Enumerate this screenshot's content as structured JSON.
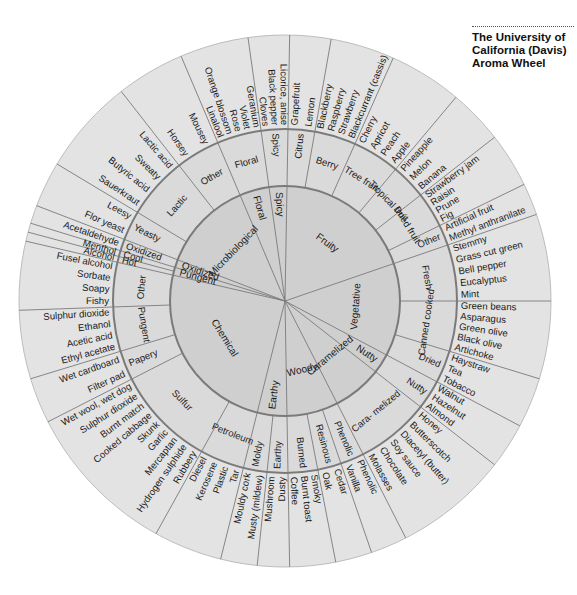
{
  "title": {
    "lines": [
      "The  University of",
      "California (Davis)",
      "Aroma Wheel"
    ]
  },
  "wheel": {
    "center": [
      285,
      301
    ],
    "radii": {
      "inner": 115,
      "middle": 172,
      "outer": 266
    },
    "colors": {
      "inner": "#cfcfcf",
      "middle": "#dadada",
      "outer": "#e3e3e3",
      "lines": "#7a7a7a"
    },
    "tier1": [
      {
        "label": "Fruity",
        "start": 1,
        "end": 71
      },
      {
        "label": "Vegetative",
        "start": 71,
        "end": 118
      },
      {
        "label": "Nutty",
        "start": 118,
        "end": 128
      },
      {
        "label": "Caramelized",
        "start": 128,
        "end": 153
      },
      {
        "label": "Woody",
        "start": 153,
        "end": 179
      },
      {
        "label": "Earthy",
        "start": 179,
        "end": 194
      },
      {
        "label": "Chemical",
        "start": 194,
        "end": 283
      },
      {
        "label": "Pungent",
        "start": 283,
        "end": 287
      },
      {
        "label": "Oxidized",
        "start": 287,
        "end": 291
      },
      {
        "label": "Microbiological",
        "start": 291,
        "end": 337
      },
      {
        "label": "Floral",
        "start": 337,
        "end": 352
      },
      {
        "label": "Spicy",
        "start": 352,
        "end": 361
      }
    ],
    "tier2": [
      {
        "label": "Citrus",
        "start": 1,
        "end": 10
      },
      {
        "label": "Berry",
        "start": 10,
        "end": 24
      },
      {
        "label": "Tree fruit",
        "start": 24,
        "end": 40
      },
      {
        "label": "Tropical fruit",
        "start": 40,
        "end": 52
      },
      {
        "label": "Dried fruit",
        "start": 52,
        "end": 64
      },
      {
        "label": "Other",
        "start": 64,
        "end": 71
      },
      {
        "label": "Fresh",
        "start": 71,
        "end": 90
      },
      {
        "label": "Canned cooked",
        "start": 90,
        "end": 107
      },
      {
        "label": "Dried",
        "start": 107,
        "end": 118
      },
      {
        "label": "Nutty",
        "start": 118,
        "end": 128
      },
      {
        "label": "Cara- melized",
        "start": 128,
        "end": 153
      },
      {
        "label": "Phenolic",
        "start": 153,
        "end": 161
      },
      {
        "label": "Resinous",
        "start": 161,
        "end": 169
      },
      {
        "label": "Burned",
        "start": 169,
        "end": 179
      },
      {
        "label": "Earthy",
        "start": 179,
        "end": 186
      },
      {
        "label": "Moldy",
        "start": 186,
        "end": 194
      },
      {
        "label": "Petroleum",
        "start": 194,
        "end": 209
      },
      {
        "label": "Sulfur",
        "start": 209,
        "end": 243
      },
      {
        "label": "Papery",
        "start": 243,
        "end": 253
      },
      {
        "label": "Pungent",
        "start": 253,
        "end": 268
      },
      {
        "label": "Other",
        "start": 268,
        "end": 283
      },
      {
        "label": "Hot",
        "start": 283,
        "end": 285
      },
      {
        "label": "Cool",
        "start": 285,
        "end": 287
      },
      {
        "label": "Oxidized",
        "start": 287,
        "end": 291
      },
      {
        "label": "Yeasty",
        "start": 291,
        "end": 301
      },
      {
        "label": "Lactic",
        "start": 301,
        "end": 322
      },
      {
        "label": "Other",
        "start": 322,
        "end": 337
      },
      {
        "label": "Floral",
        "start": 337,
        "end": 352
      },
      {
        "label": "Spicy",
        "start": 352,
        "end": 361
      }
    ],
    "tier3": [
      {
        "group": "Citrus",
        "start": 1,
        "end": 10,
        "items": [
          "Grapefruit",
          "Lemon"
        ]
      },
      {
        "group": "Berry",
        "start": 10,
        "end": 24,
        "items": [
          "Blackberry",
          "Raspberry",
          "Strawberry",
          "Blackcurrant (cassis)"
        ]
      },
      {
        "group": "Tree fruit",
        "start": 24,
        "end": 40,
        "items": [
          "Cherry",
          "Apricot",
          "Peach",
          "Apple"
        ]
      },
      {
        "group": "Tropical fruit",
        "start": 40,
        "end": 52,
        "items": [
          "Pineapple",
          "Melon",
          "Banana"
        ]
      },
      {
        "group": "Dried fruit",
        "start": 52,
        "end": 64,
        "items": [
          "Strawberry jam",
          "Raisin",
          "Prune",
          "Fig"
        ]
      },
      {
        "group": "Other",
        "start": 64,
        "end": 71,
        "items": [
          "Artificial fruit",
          "Methyl anthranilate"
        ]
      },
      {
        "group": "Fresh",
        "start": 71,
        "end": 90,
        "items": [
          "Stemmy",
          "Grass cut green",
          "Bell pepper",
          "Eucalyptus",
          "Mint"
        ]
      },
      {
        "group": "Canned cooked",
        "start": 90,
        "end": 107,
        "items": [
          "Green beans",
          "Asparagus",
          "Green olive",
          "Black olive",
          "Artichoke"
        ]
      },
      {
        "group": "Dried",
        "start": 107,
        "end": 118,
        "items": [
          "Haystraw",
          "Tea",
          "Tobacco"
        ]
      },
      {
        "group": "Nutty",
        "start": 118,
        "end": 128,
        "items": [
          "Walnut",
          "Hazelnut",
          "Almond"
        ]
      },
      {
        "group": "Caramelized",
        "start": 128,
        "end": 153,
        "items": [
          "Honey",
          "Butterscotch",
          "Diacetyl (butter)",
          "Soy sauce",
          "Chocolate",
          "Molasses"
        ]
      },
      {
        "group": "Phenolic",
        "start": 153,
        "end": 161,
        "items": [
          "Phenolic",
          "Vanilla"
        ]
      },
      {
        "group": "Resinous",
        "start": 161,
        "end": 169,
        "items": [
          "Cedar",
          "Oak"
        ]
      },
      {
        "group": "Burned",
        "start": 169,
        "end": 179,
        "items": [
          "Smoky",
          "Burnt toast",
          "Coffee"
        ]
      },
      {
        "group": "Earthy",
        "start": 179,
        "end": 186,
        "items": [
          "Dusty",
          "Mushroom"
        ]
      },
      {
        "group": "Moldy",
        "start": 186,
        "end": 194,
        "items": [
          "Musty (mildew)",
          "Mouldy cork"
        ]
      },
      {
        "group": "Petroleum",
        "start": 194,
        "end": 209,
        "items": [
          "Tar",
          "Plastic",
          "Kerosene",
          "Diesel"
        ]
      },
      {
        "group": "Sulfur",
        "start": 209,
        "end": 243,
        "items": [
          "Rubbery",
          "Hydrogen sulphide",
          "Mercaptan",
          "Garlic",
          "Skunk",
          "Cooked cabbage",
          "Burnt match",
          "Sulphur dioxide",
          "Wet wool, wet dog"
        ]
      },
      {
        "group": "Papery",
        "start": 243,
        "end": 253,
        "items": [
          "Filter pad",
          "Wet cardboard"
        ]
      },
      {
        "group": "Pungent",
        "start": 253,
        "end": 268,
        "items": [
          "Ethyl acetate",
          "Acetic acid",
          "Ethanol",
          "Sulphur dioxide"
        ]
      },
      {
        "group": "Other",
        "start": 268,
        "end": 283,
        "items": [
          "Fishy",
          "Soapy",
          "Sorbate",
          "Fusel alcohol"
        ]
      },
      {
        "group": "Hot",
        "start": 283,
        "end": 285,
        "items": [
          "Alcohol"
        ]
      },
      {
        "group": "Cool",
        "start": 285,
        "end": 287,
        "items": [
          "Menthol"
        ]
      },
      {
        "group": "Oxidized",
        "start": 287,
        "end": 291,
        "items": [
          "Acetaldehyde"
        ]
      },
      {
        "group": "Yeasty",
        "start": 291,
        "end": 301,
        "items": [
          "Flor yeast",
          "Leesy"
        ]
      },
      {
        "group": "Lactic",
        "start": 301,
        "end": 322,
        "items": [
          "Sauerkraut",
          "Butyric acid",
          "Sweaty",
          "Lactic acid"
        ]
      },
      {
        "group": "Other",
        "start": 322,
        "end": 337,
        "items": [
          "Horsey",
          "Mousey"
        ]
      },
      {
        "group": "Floral",
        "start": 337,
        "end": 352,
        "items": [
          "Linalool",
          "Orange blossom",
          "Rose",
          "Violet",
          "Geranium"
        ]
      },
      {
        "group": "Spicy",
        "start": 352,
        "end": 361,
        "items": [
          "Cloves",
          "Black pepper",
          "Licorice, anise"
        ]
      }
    ]
  }
}
